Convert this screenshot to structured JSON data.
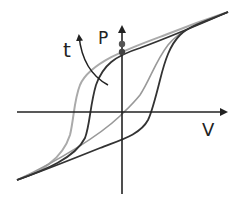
{
  "diagram": {
    "type": "hysteresis-loop",
    "labels": {
      "y_axis": "P",
      "x_axis": "V",
      "time_arrow": "t"
    },
    "colors": {
      "axis": "#222222",
      "loop_dark": "#333333",
      "loop_mid": "#777777",
      "loop_light": "#aaaaaa",
      "dots": "#444444"
    },
    "loops": [
      {
        "name": "outer-loop",
        "shade": "light"
      },
      {
        "name": "inner-loop",
        "shade": "dark"
      }
    ],
    "markers": [
      {
        "name": "remanent-polarization-upper"
      },
      {
        "name": "remanent-polarization-lower"
      }
    ]
  }
}
